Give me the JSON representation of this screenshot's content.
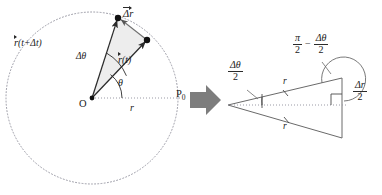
{
  "figure": {
    "background_color": "#ffffff",
    "stroke_color": "#2b2b2b",
    "dotted_color": "#9a9aa5",
    "fill_color": "#eeeeee",
    "arrow_color": "#7d7d7d"
  },
  "left_diagram": {
    "name": "circular-path-diagram",
    "circle": {
      "cx": 92,
      "cy": 98,
      "r": 86,
      "style": "dotted"
    },
    "origin_label": "O",
    "point_label": "P",
    "point_subscript": "0",
    "radius_label": "r",
    "angle_theta": "θ",
    "angle_delta_theta": "Δθ",
    "vector_rt": {
      "symbol": "r",
      "arg": "(t)"
    },
    "vector_rt_dt": {
      "symbol": "r",
      "arg": "(t+Δt)"
    },
    "vector_delta_r": {
      "symbol": "Δr"
    },
    "points": {
      "origin": [
        92,
        98
      ],
      "p_t": [
        147,
        40
      ],
      "p_t_dt": [
        118,
        18
      ],
      "p_zero": [
        178,
        98
      ]
    }
  },
  "transition_arrow": {
    "name": "block-arrow-right",
    "color": "#7d7d7d"
  },
  "right_diagram": {
    "name": "isoceles-triangle-diagram",
    "apex_angle_label": {
      "num": "Δθ",
      "den": "2"
    },
    "upper_side_label": "r",
    "lower_side_label": "r",
    "top_angle_label": {
      "pi_num": "π",
      "pi_den": "2",
      "minus": "−",
      "dtheta_num": "Δθ",
      "dtheta_den": "2"
    },
    "opposite_side_label": {
      "num": "Δr",
      "den": "2"
    },
    "right_angle_mark": true,
    "vertices": {
      "apex": [
        228,
        105
      ],
      "top_right": [
        342,
        78
      ],
      "bottom_right": [
        342,
        138
      ]
    }
  }
}
